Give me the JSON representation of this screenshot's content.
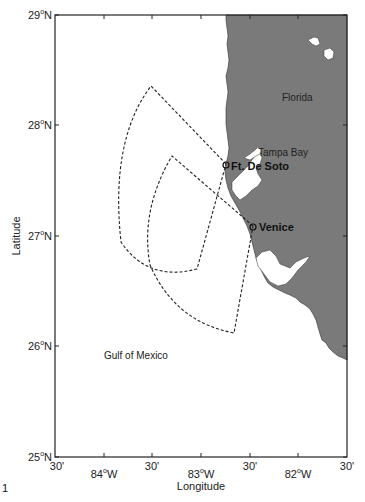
{
  "figure": {
    "number_label": "1",
    "xlabel": "Longitude",
    "ylabel": "Latitude"
  },
  "axes": {
    "lat_ticks": [
      {
        "value": 29,
        "label": "29",
        "suffix": "N"
      },
      {
        "value": 28,
        "label": "28",
        "suffix": "N"
      },
      {
        "value": 27,
        "label": "27",
        "suffix": "N"
      },
      {
        "value": 26,
        "label": "26",
        "suffix": "N"
      },
      {
        "value": 25,
        "label": "25",
        "suffix": "N"
      }
    ],
    "lon_ticks": [
      {
        "value": -84.5,
        "label": "30'"
      },
      {
        "value": -84.0,
        "label": "84",
        "suffix": "W"
      },
      {
        "value": -83.5,
        "label": "30'"
      },
      {
        "value": -83.0,
        "label": "83",
        "suffix": "W"
      },
      {
        "value": -82.5,
        "label": "30'"
      },
      {
        "value": -82.0,
        "label": "82",
        "suffix": "W"
      },
      {
        "value": -81.5,
        "label": "30'"
      }
    ],
    "lat_range": [
      25,
      29
    ],
    "lon_range": [
      -84.5,
      -81.5
    ]
  },
  "labels": {
    "florida": "Florida",
    "tampa_bay": "Tampa Bay",
    "ft_de_soto": "Ft. De Soto",
    "venice": "Venice",
    "gulf": "Gulf of Mexico"
  },
  "stations": [
    {
      "name": "Ft. De Soto",
      "lat": 27.62,
      "lon": -82.73
    },
    {
      "name": "Venice",
      "lat": 27.08,
      "lon": -82.46
    }
  ],
  "colors": {
    "land": "#7a7a7a",
    "water": "#ffffff",
    "coverage_line": "#222222",
    "axis": "#222222"
  }
}
